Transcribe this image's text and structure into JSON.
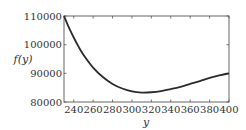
{
  "chart_data": {
    "type": "line",
    "title": "",
    "xlabel": "y",
    "ylabel": "f(y)",
    "xlim": [
      230,
      400
    ],
    "ylim": [
      80000,
      110000
    ],
    "grid": false,
    "legend": null,
    "xticks": [
      240,
      260,
      280,
      300,
      320,
      340,
      360,
      380,
      400
    ],
    "yticks": [
      80000,
      90000,
      100000,
      110000
    ],
    "series": [
      {
        "name": "f(y)",
        "color": "#2b2b2b",
        "x": [
          230,
          235,
          240,
          245,
          250,
          260,
          270,
          280,
          290,
          300,
          310,
          320,
          330,
          340,
          350,
          360,
          370,
          380,
          390,
          400
        ],
        "y": [
          110000,
          106000,
          102500,
          99300,
          96500,
          92000,
          88700,
          86300,
          84700,
          83700,
          83300,
          83400,
          83800,
          84500,
          85300,
          86300,
          87300,
          88400,
          89300,
          90000
        ]
      }
    ]
  }
}
